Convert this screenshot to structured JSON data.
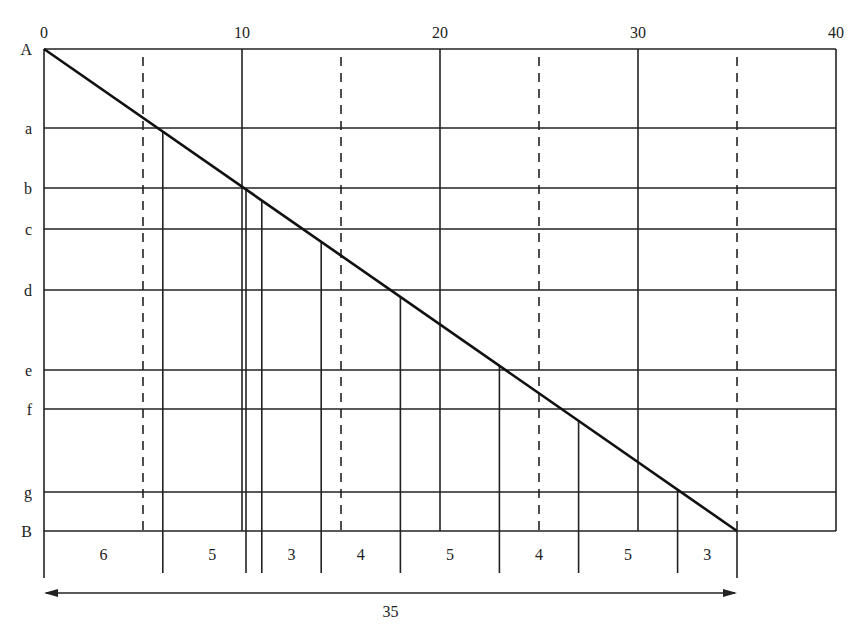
{
  "x_axis": {
    "ticks": [
      {
        "value": 0,
        "label": "0"
      },
      {
        "value": 10,
        "label": "10"
      },
      {
        "value": 20,
        "label": "20"
      },
      {
        "value": 30,
        "label": "30"
      },
      {
        "value": 40,
        "label": "40"
      }
    ],
    "dashed_lines_at": [
      5,
      15,
      25,
      35
    ]
  },
  "rows": [
    {
      "label": "A"
    },
    {
      "label": "a"
    },
    {
      "label": "b"
    },
    {
      "label": "c"
    },
    {
      "label": "d"
    },
    {
      "label": "e"
    },
    {
      "label": "f"
    },
    {
      "label": "g"
    },
    {
      "label": "B"
    }
  ],
  "segments": [
    {
      "label": "6",
      "value": 6
    },
    {
      "label": "5",
      "value": 5
    },
    {
      "label": "3",
      "value": 3
    },
    {
      "label": "4",
      "value": 4
    },
    {
      "label": "5",
      "value": 5
    },
    {
      "label": "4",
      "value": 4
    },
    {
      "label": "5",
      "value": 5
    },
    {
      "label": "3",
      "value": 3
    }
  ],
  "total": {
    "label": "35",
    "value": 35
  },
  "colors": {
    "line": "#222222",
    "background": "#ffffff"
  }
}
